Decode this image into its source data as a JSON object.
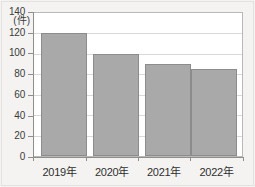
{
  "chart_data": {
    "type": "bar",
    "title": "",
    "xlabel": "",
    "ylabel": "",
    "unit_label": "(件)",
    "categories": [
      "2019年",
      "2020年",
      "2021年",
      "2022年"
    ],
    "values": [
      120,
      100,
      90,
      85
    ],
    "ylim": [
      0,
      140
    ],
    "ytick_values": [
      0,
      20,
      40,
      60,
      80,
      100,
      120,
      140
    ],
    "ytick_labels": [
      "0",
      "20",
      "40",
      "60",
      "80",
      "100",
      "120",
      "140"
    ],
    "grid": true,
    "legend": null,
    "colors": {
      "bar_fill": "#a9a9a9",
      "bar_stroke": "#8c8c8c",
      "plot_background": "#ffffff",
      "page_background": "#f4f3f1",
      "gridline": "#d9d9d7",
      "axis": "#8e8e8c",
      "text": "#2f2f2f"
    }
  }
}
